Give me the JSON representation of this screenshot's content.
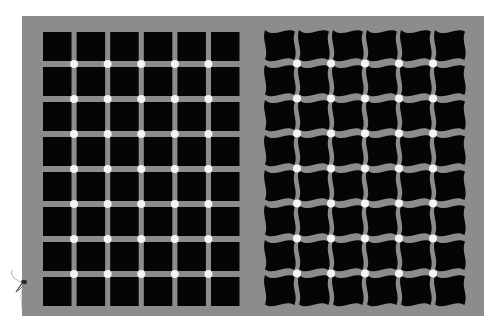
{
  "figure": {
    "title": "Scintillating grid illusion",
    "colors": {
      "page": "#ffffff",
      "panel": "#8c8c8c",
      "tile": "#050505",
      "dot": "#f4f4f4",
      "insect": "#2a2a2a"
    },
    "panel": {
      "x": 22,
      "y": 16,
      "width": 462,
      "height": 300
    },
    "left_grid": {
      "type": "straight",
      "cols": 6,
      "rows": 8,
      "origin_x": 43,
      "origin_y": 32,
      "tile_w": 28.5,
      "tile_h": 29,
      "pitch_x": 33.6,
      "pitch_y": 35,
      "dot_radius": 4
    },
    "right_grid": {
      "type": "wavy",
      "cols": 6,
      "rows": 8,
      "origin_x": 265,
      "origin_y": 30,
      "tile_w": 30,
      "tile_h": 30,
      "pitch_x": 34,
      "pitch_y": 35,
      "dot_radius": 4
    },
    "insect": {
      "x": 20,
      "y": 282
    }
  }
}
